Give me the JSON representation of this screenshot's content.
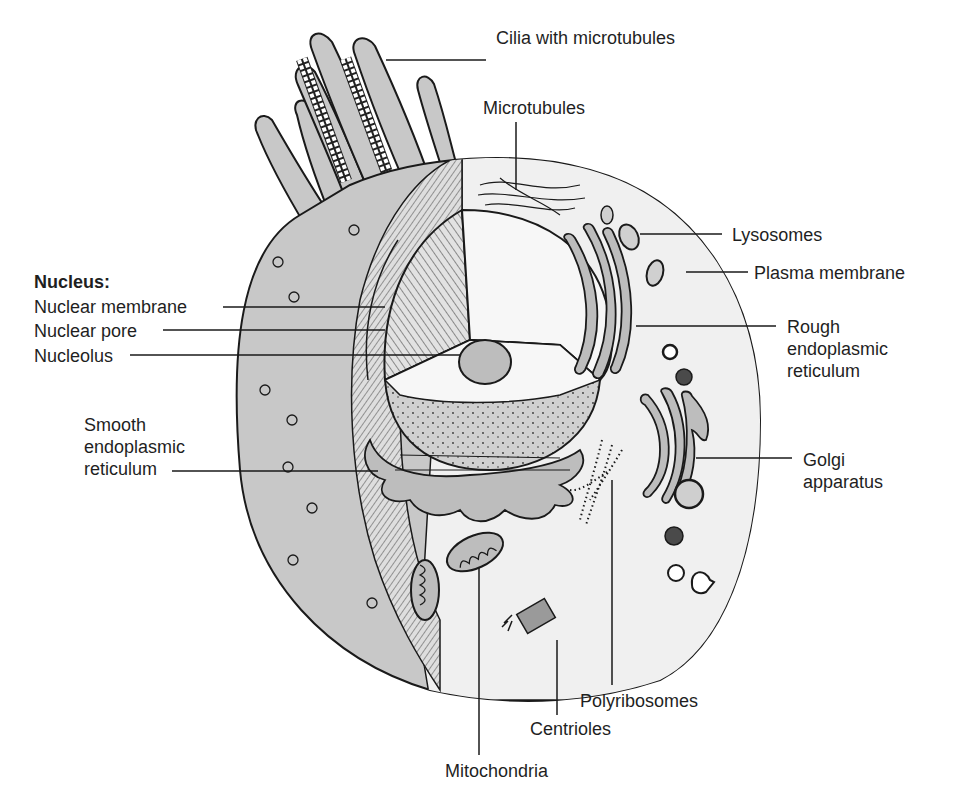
{
  "diagram": {
    "type": "labeled-illustration",
    "colors": {
      "cytoplasm_left": "#c8c8c8",
      "cytoplasm_right": "#f0f0f0",
      "hatch_section": "#d9d9d9",
      "nucleus_interior": "#f7f7f7",
      "nucleoplasm_lower": "#cfcfcf",
      "organelle_fill": "#bdbdbd",
      "dark_granule": "#4a4a4a",
      "outline": "#1a1a1a",
      "label_text": "#1f1f1f"
    }
  },
  "labels": {
    "cilia": "Cilia with microtubules",
    "microtubules": "Microtubules",
    "lysosomes": "Lysosomes",
    "plasma_membrane": "Plasma membrane",
    "nucleus_heading": "Nucleus:",
    "nuclear_membrane": "Nuclear membrane",
    "nuclear_pore": "Nuclear pore",
    "nucleolus": "Nucleolus",
    "rough_er": [
      "Rough",
      "endoplasmic",
      "reticulum"
    ],
    "smooth_er": [
      "Smooth",
      "endoplasmic",
      "reticulum"
    ],
    "golgi": [
      "Golgi",
      "apparatus"
    ],
    "polyribosomes": "Polyribosomes",
    "centrioles": "Centrioles",
    "mitochondria": "Mitochondria"
  }
}
